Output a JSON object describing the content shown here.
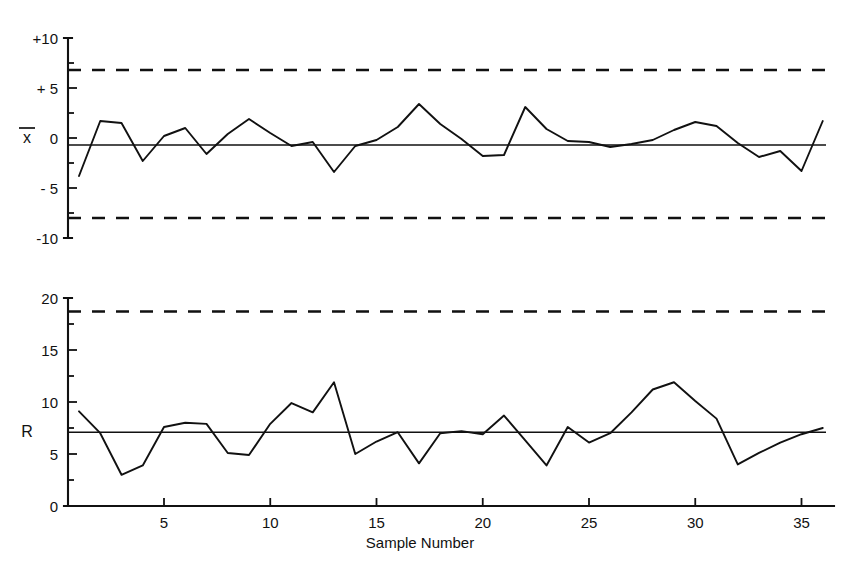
{
  "figure": {
    "background": "#ffffff",
    "ink_color": "#111111",
    "xlabel": "Sample Number"
  },
  "chart_data": [
    {
      "type": "line",
      "id": "xbar-chart",
      "title": "",
      "series_label": "x̄",
      "xlabel": "Sample Number",
      "ylabel": "",
      "x": [
        1,
        2,
        3,
        4,
        5,
        6,
        7,
        8,
        9,
        10,
        11,
        12,
        13,
        14,
        15,
        16,
        17,
        18,
        19,
        20,
        21,
        22,
        23,
        24,
        25,
        26,
        27,
        28,
        29,
        30,
        31,
        32,
        33,
        34,
        35,
        36
      ],
      "values": [
        -3.8,
        1.7,
        1.5,
        -2.3,
        0.2,
        1.0,
        -1.6,
        0.4,
        1.9,
        0.5,
        -0.8,
        -0.4,
        -3.4,
        -0.8,
        -0.2,
        1.1,
        3.4,
        1.4,
        -0.1,
        -1.8,
        -1.7,
        3.1,
        0.9,
        -0.3,
        -0.4,
        -0.9,
        -0.6,
        -0.2,
        0.8,
        1.6,
        1.2,
        -0.5,
        -1.9,
        -1.3,
        -3.3,
        1.7
      ],
      "xticks": [
        5,
        10,
        15,
        20,
        25,
        30,
        35
      ],
      "yticks": [
        -10,
        -5,
        0,
        5,
        10
      ],
      "ytick_labels": [
        "-10",
        "- 5",
        "0",
        "+ 5",
        "+10"
      ],
      "ylim": [
        -10,
        10
      ],
      "xlim": [
        0.3,
        36.6
      ],
      "center_line": -0.7,
      "upper_control_limit": 6.8,
      "lower_control_limit": -8.0,
      "grid": false,
      "legend": "none"
    },
    {
      "type": "line",
      "id": "r-chart",
      "title": "",
      "series_label": "R",
      "xlabel": "Sample Number",
      "ylabel": "",
      "x": [
        1,
        2,
        3,
        4,
        5,
        6,
        7,
        8,
        9,
        10,
        11,
        12,
        13,
        14,
        15,
        16,
        17,
        18,
        19,
        20,
        21,
        22,
        23,
        24,
        25,
        26,
        27,
        28,
        29,
        30,
        31,
        32,
        33,
        34,
        35,
        36
      ],
      "values": [
        9.1,
        7.0,
        3.0,
        3.9,
        7.6,
        8.0,
        7.9,
        5.1,
        4.9,
        7.9,
        9.9,
        9.0,
        11.9,
        5.0,
        6.2,
        7.1,
        4.1,
        7.0,
        7.2,
        6.9,
        8.7,
        6.3,
        3.9,
        7.6,
        6.1,
        7.0,
        9.0,
        11.2,
        11.9,
        10.1,
        8.4,
        4.0,
        5.1,
        6.1,
        6.9,
        7.5
      ],
      "xticks": [
        5,
        10,
        15,
        20,
        25,
        30,
        35
      ],
      "yticks": [
        0,
        5,
        10,
        15,
        20
      ],
      "ytick_labels": [
        "0",
        "5",
        "10",
        "15",
        "20"
      ],
      "ylim": [
        0,
        20
      ],
      "xlim": [
        0.3,
        36.6
      ],
      "center_line": 7.1,
      "upper_control_limit": 18.7,
      "grid": false,
      "legend": "none"
    }
  ]
}
